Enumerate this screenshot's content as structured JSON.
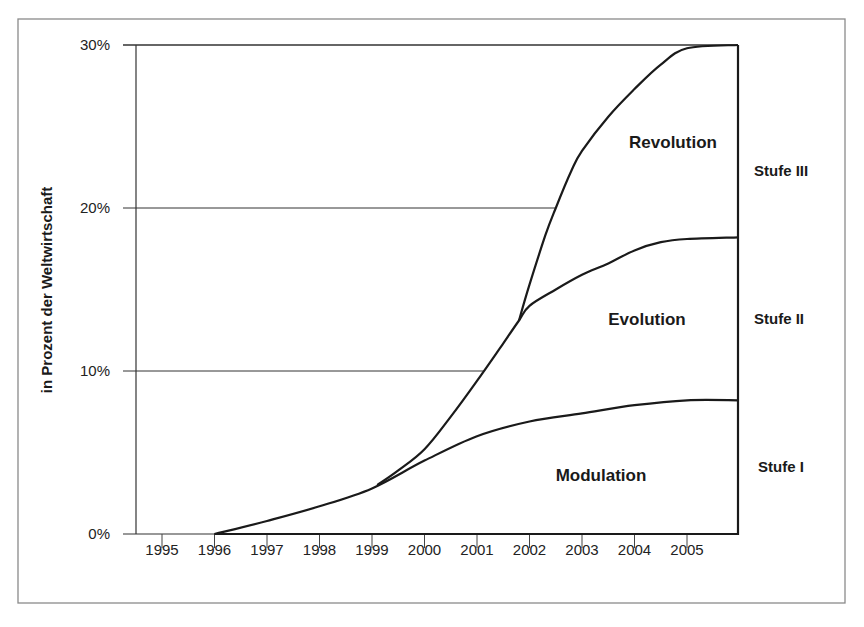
{
  "chart_data": {
    "type": "area",
    "title": "",
    "xlabel": "",
    "ylabel": "in Prozent der Weltwirtschaft",
    "ylim": [
      0,
      30
    ],
    "xlim": [
      1995,
      2006
    ],
    "grid": true,
    "y_ticks": [
      "0%",
      "10%",
      "20%",
      "30%"
    ],
    "y_tick_values": [
      0,
      10,
      20,
      30
    ],
    "x_ticks": [
      "1995",
      "1996",
      "1997",
      "1998",
      "1999",
      "2000",
      "2001",
      "2002",
      "2003",
      "2004",
      "2005"
    ],
    "x_tick_values": [
      1995,
      1996,
      1997,
      1998,
      1999,
      2000,
      2001,
      2002,
      2003,
      2004,
      2005
    ],
    "series": [
      {
        "name": "Modulation",
        "stage": "Stufe I",
        "points": [
          [
            1996,
            0
          ],
          [
            1997,
            0.8
          ],
          [
            1998,
            1.7
          ],
          [
            1999,
            2.8
          ],
          [
            2000,
            4.5
          ],
          [
            2001,
            6.0
          ],
          [
            2002,
            6.9
          ],
          [
            2003,
            7.4
          ],
          [
            2004,
            7.9
          ],
          [
            2005,
            8.2
          ],
          [
            2006,
            8.2
          ]
        ]
      },
      {
        "name": "Evolution",
        "stage": "Stufe II",
        "points": [
          [
            1999.1,
            3.0
          ],
          [
            1999.5,
            3.9
          ],
          [
            2000,
            5.2
          ],
          [
            2000.5,
            7.2
          ],
          [
            2001,
            9.4
          ],
          [
            2001.5,
            11.7
          ],
          [
            2001.8,
            13.1
          ],
          [
            2002,
            14.0
          ],
          [
            2002.5,
            15.0
          ],
          [
            2003,
            15.9
          ],
          [
            2003.5,
            16.6
          ],
          [
            2004,
            17.4
          ],
          [
            2004.5,
            17.9
          ],
          [
            2005,
            18.1
          ],
          [
            2006,
            18.2
          ]
        ]
      },
      {
        "name": "Revolution",
        "stage": "Stufe III",
        "points": [
          [
            2001.8,
            13.1
          ],
          [
            2002,
            15.3
          ],
          [
            2002.3,
            18.3
          ],
          [
            2002.5,
            20.0
          ],
          [
            2002.8,
            22.3
          ],
          [
            2003,
            23.5
          ],
          [
            2003.5,
            25.6
          ],
          [
            2004,
            27.3
          ],
          [
            2004.5,
            28.8
          ],
          [
            2005,
            29.8
          ],
          [
            2006,
            30.0
          ]
        ]
      }
    ],
    "annotations": [
      {
        "text": "Revolution",
        "x": 2003.7,
        "y": 24
      },
      {
        "text": "Evolution",
        "x": 2003.4,
        "y": 13
      },
      {
        "text": "Modulation",
        "x": 2003.4,
        "y": 3.8
      },
      {
        "text": "Stufe III",
        "side": "right",
        "y": 24
      },
      {
        "text": "Stufe II",
        "side": "right",
        "y": 13.2
      },
      {
        "text": "Stufe I",
        "side": "right",
        "y": 4.2
      }
    ]
  },
  "labels": {
    "ylabel": "in Prozent der Weltwirtschaft",
    "y_ticks": [
      "0%",
      "10%",
      "20%",
      "30%"
    ],
    "x_ticks": [
      "1995",
      "1996",
      "1997",
      "1998",
      "1999",
      "2000",
      "2001",
      "2002",
      "2003",
      "2004",
      "2005"
    ],
    "regions": {
      "revolution": "Revolution",
      "evolution": "Evolution",
      "modulation": "Modulation"
    },
    "stages": {
      "stage3": "Stufe III",
      "stage2": "Stufe II",
      "stage1": "Stufe I"
    }
  },
  "colors": {
    "line": "#1a1a1a",
    "grid": "#333333",
    "frame": "#8a8a8a",
    "background": "#ffffff"
  }
}
